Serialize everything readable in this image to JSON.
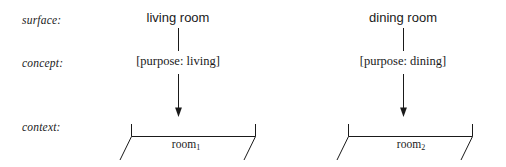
{
  "diagram": {
    "title": "",
    "ink_color": "#1a1a1a",
    "background": "#ffffff",
    "rows": [
      {
        "id": "surface",
        "label": "surface:"
      },
      {
        "id": "concept",
        "label": "concept:"
      },
      {
        "id": "context",
        "label": "context:"
      }
    ],
    "columns": [
      {
        "id": "living",
        "surface": "living room",
        "concept": "[purpose: living]",
        "context": "room",
        "context_subscript": "1"
      },
      {
        "id": "dining",
        "surface": "dining room",
        "concept": "[purpose: dining]",
        "context": "room",
        "context_subscript": "2"
      }
    ],
    "connectors": [
      {
        "id": "living-surface-to-concept",
        "kind": "plain-line"
      },
      {
        "id": "living-concept-to-context",
        "kind": "arrow-down"
      },
      {
        "id": "dining-surface-to-concept",
        "kind": "plain-line"
      },
      {
        "id": "dining-concept-to-context",
        "kind": "arrow-down"
      }
    ],
    "brackets": [
      {
        "id": "living-context-bracket",
        "kind": "span-bracket-with-slashes"
      },
      {
        "id": "dining-context-bracket",
        "kind": "span-bracket-with-slashes"
      }
    ]
  }
}
